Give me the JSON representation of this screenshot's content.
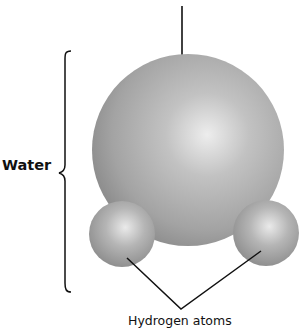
{
  "diagram": {
    "labels": {
      "molecule": "Water",
      "hydrogen": "Hydrogen atoms"
    },
    "atoms": [
      {
        "name": "oxygen",
        "cx": 188,
        "cy": 150,
        "r": 96,
        "color": "#a6a6a6"
      },
      {
        "name": "hydrogen-left",
        "cx": 122,
        "cy": 234,
        "r": 33,
        "color": "#a6a6a6"
      },
      {
        "name": "hydrogen-right",
        "cx": 266,
        "cy": 233,
        "r": 33,
        "color": "#a6a6a6"
      }
    ],
    "colors": {
      "sphere_highlight": "#eeeeee",
      "sphere_mid": "#b0b0b0",
      "sphere_edge": "#8c8c8c",
      "line": "#111111"
    }
  }
}
